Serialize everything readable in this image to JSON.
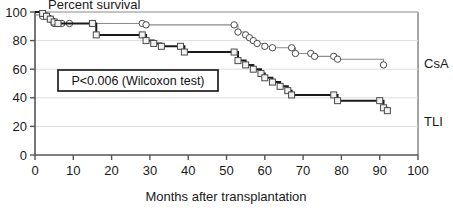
{
  "chart_data": {
    "type": "line",
    "title": "Percent survival",
    "xlabel": "Months after transplantation",
    "ylabel": "Percent survival",
    "xlim": [
      0,
      100
    ],
    "ylim": [
      0,
      100
    ],
    "xticks": [
      "0",
      "10",
      "20",
      "30",
      "40",
      "50",
      "60",
      "70",
      "80",
      "90",
      "100"
    ],
    "yticks": [
      "0",
      "20",
      "40",
      "60",
      "80",
      "100"
    ],
    "grid": "horizontal",
    "legend_position": "right-inline",
    "annotation": "P<0.006 (Wilcoxon test)",
    "series": [
      {
        "name": "CsA",
        "label": "CsA",
        "color": "#8c8c8c",
        "marker": "circle",
        "step": "post",
        "points": [
          [
            0,
            98
          ],
          [
            2,
            97
          ],
          [
            4,
            95
          ],
          [
            5,
            92
          ],
          [
            7,
            92
          ],
          [
            9,
            92
          ],
          [
            28,
            92
          ],
          [
            29,
            91
          ],
          [
            52,
            91
          ],
          [
            53,
            86
          ],
          [
            55,
            84
          ],
          [
            56,
            82
          ],
          [
            57,
            80
          ],
          [
            58,
            78
          ],
          [
            60,
            76
          ],
          [
            62,
            75
          ],
          [
            67,
            75
          ],
          [
            68,
            71
          ],
          [
            72,
            71
          ],
          [
            73,
            69
          ],
          [
            78,
            69
          ],
          [
            79,
            67
          ],
          [
            91,
            63
          ]
        ]
      },
      {
        "name": "TLI",
        "label": "TLI",
        "color": "#1a1a1a",
        "marker": "square",
        "step": "post",
        "points": [
          [
            0,
            100
          ],
          [
            2,
            99
          ],
          [
            3,
            97
          ],
          [
            4,
            95
          ],
          [
            5,
            93
          ],
          [
            6,
            92
          ],
          [
            15,
            92
          ],
          [
            16,
            84
          ],
          [
            28,
            84
          ],
          [
            29,
            80
          ],
          [
            31,
            78
          ],
          [
            33,
            76
          ],
          [
            38,
            76
          ],
          [
            39,
            72
          ],
          [
            52,
            72
          ],
          [
            53,
            66
          ],
          [
            55,
            63
          ],
          [
            57,
            60
          ],
          [
            59,
            57
          ],
          [
            60,
            54
          ],
          [
            62,
            51
          ],
          [
            64,
            48
          ],
          [
            66,
            45
          ],
          [
            67,
            42
          ],
          [
            78,
            42
          ],
          [
            79,
            38
          ],
          [
            90,
            38
          ],
          [
            91,
            33
          ],
          [
            92,
            31
          ]
        ]
      }
    ]
  },
  "axis": {
    "x_title": "Months after transplantation",
    "y_title": "Percent survival"
  },
  "labels": {
    "csa": "CsA",
    "tli": "TLI",
    "pvalue": "P<0.006 (Wilcoxon test)"
  }
}
